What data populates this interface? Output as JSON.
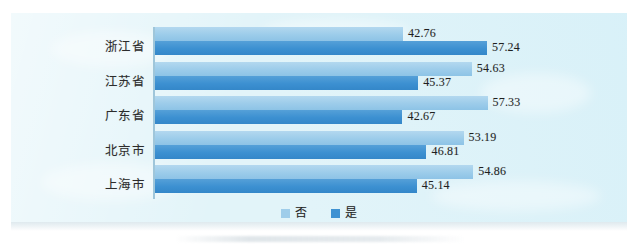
{
  "chart_data": {
    "type": "bar",
    "orientation": "horizontal",
    "grouped": true,
    "title": "",
    "subtitle": "",
    "xlabel": "",
    "ylabel": "",
    "grid": false,
    "axis_visible": {
      "y_spine": true,
      "x_axis_ticks": false
    },
    "xlim": [
      0,
      100
    ],
    "value_label_format": "two-decimal",
    "legend": {
      "position": "bottom-center",
      "entries": [
        {
          "label": "否",
          "color": "#9fcdea"
        },
        {
          "label": "是",
          "color": "#3f92d2"
        }
      ]
    },
    "categories": [
      "浙江省",
      "江苏省",
      "广东省",
      "北京市",
      "上海市"
    ],
    "series": [
      {
        "name": "否",
        "color": "#9fcdea",
        "values": [
          42.76,
          54.63,
          57.33,
          53.19,
          54.86
        ]
      },
      {
        "name": "是",
        "color": "#3f92d2",
        "values": [
          57.24,
          45.37,
          42.67,
          46.81,
          45.14
        ]
      }
    ],
    "groups": [
      {
        "category": "浙江省",
        "bars": [
          {
            "series": "否",
            "value": 42.76,
            "label": "42.76"
          },
          {
            "series": "是",
            "value": 57.24,
            "label": "57.24"
          }
        ]
      },
      {
        "category": "江苏省",
        "bars": [
          {
            "series": "否",
            "value": 54.63,
            "label": "54.63"
          },
          {
            "series": "是",
            "value": 45.37,
            "label": "45.37"
          }
        ]
      },
      {
        "category": "广东省",
        "bars": [
          {
            "series": "否",
            "value": 57.33,
            "label": "57.33"
          },
          {
            "series": "是",
            "value": 42.67,
            "label": "42.67"
          }
        ]
      },
      {
        "category": "北京市",
        "bars": [
          {
            "series": "否",
            "value": 53.19,
            "label": "53.19"
          },
          {
            "series": "是",
            "value": 46.81,
            "label": "46.81"
          }
        ]
      },
      {
        "category": "上海市",
        "bars": [
          {
            "series": "否",
            "value": 54.86,
            "label": "54.86"
          },
          {
            "series": "是",
            "value": 45.14,
            "label": "45.14"
          }
        ]
      }
    ]
  },
  "colors": {
    "panel_background": "#e2f4f9",
    "page_background": "#ffffff",
    "axis": "#9fc6da",
    "series_no": "#9fcdea",
    "series_yes": "#3f92d2",
    "text": "#232323"
  }
}
